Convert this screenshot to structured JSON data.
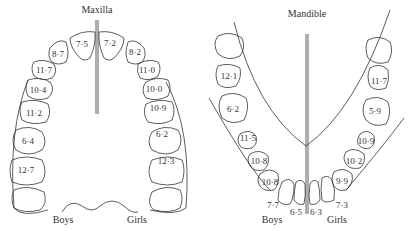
{
  "maxilla": {
    "title": "Maxilla",
    "boys_label": "Boys",
    "girls_label": "Girls",
    "boys_values": [
      "7·5",
      "8·7",
      "11·7",
      "10·4",
      "11·2",
      "6·4",
      "12·7"
    ],
    "girls_values": [
      "7·2",
      "8·2",
      "11·0",
      "10·0",
      "10·9",
      "6·2",
      "12·3"
    ]
  },
  "mandible": {
    "title": "Mandible",
    "boys_label": "Boys",
    "girls_label": "Girls",
    "boys_values": [
      "12·1",
      "6·2",
      "11·5",
      "10·8",
      "10·8",
      "7·7",
      "6·5"
    ],
    "girls_values": [
      "11·7",
      "5·9",
      "10·9",
      "10·2",
      "9·9",
      "7·3",
      "6·3"
    ]
  }
}
